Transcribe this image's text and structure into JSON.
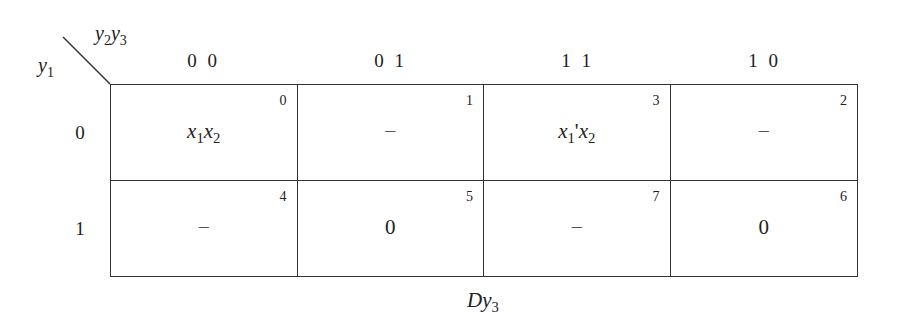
{
  "kmap": {
    "corner": {
      "col_var_1": "y",
      "col_var_1_sub": "2",
      "col_var_2": "y",
      "col_var_2_sub": "3",
      "row_var": "y",
      "row_var_sub": "1"
    },
    "column_headers": [
      "0 0",
      "0 1",
      "1 1",
      "1 0"
    ],
    "row_headers": [
      "0",
      "1"
    ],
    "cells": [
      [
        {
          "index": "0",
          "value": "x1x2",
          "display": {
            "a": "x",
            "a_sub": "1",
            "b": "x",
            "b_sub": "2",
            "prime": ""
          }
        },
        {
          "index": "1",
          "value": "–"
        },
        {
          "index": "3",
          "value": "x1'x2",
          "display": {
            "a": "x",
            "a_sub": "1",
            "b": "x",
            "b_sub": "2",
            "prime": "'"
          }
        },
        {
          "index": "2",
          "value": "–"
        }
      ],
      [
        {
          "index": "4",
          "value": "–"
        },
        {
          "index": "5",
          "value": "0"
        },
        {
          "index": "7",
          "value": "–"
        },
        {
          "index": "6",
          "value": "0"
        }
      ]
    ],
    "caption": {
      "main": "Dy",
      "sub": "3"
    }
  }
}
